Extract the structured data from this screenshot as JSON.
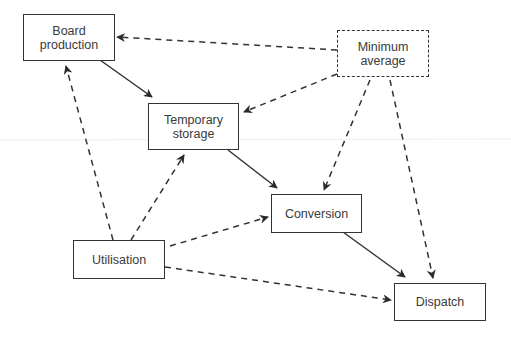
{
  "diagram": {
    "type": "flow",
    "nodes": [
      {
        "id": "board_production",
        "label": "Board\nproduction",
        "style": "solid"
      },
      {
        "id": "temporary_storage",
        "label": "Temporary\nstorage",
        "style": "solid"
      },
      {
        "id": "minimum_average",
        "label": "Minimum\naverage",
        "style": "dashed"
      },
      {
        "id": "conversion",
        "label": "Conversion",
        "style": "solid"
      },
      {
        "id": "utilisation",
        "label": "Utilisation",
        "style": "solid"
      },
      {
        "id": "dispatch",
        "label": "Dispatch",
        "style": "solid"
      }
    ],
    "edges": [
      {
        "from": "board_production",
        "to": "temporary_storage",
        "style": "solid"
      },
      {
        "from": "temporary_storage",
        "to": "conversion",
        "style": "solid"
      },
      {
        "from": "conversion",
        "to": "dispatch",
        "style": "solid"
      },
      {
        "from": "minimum_average",
        "to": "board_production",
        "style": "dashed"
      },
      {
        "from": "minimum_average",
        "to": "temporary_storage",
        "style": "dashed"
      },
      {
        "from": "minimum_average",
        "to": "conversion",
        "style": "dashed"
      },
      {
        "from": "minimum_average",
        "to": "dispatch",
        "style": "dashed"
      },
      {
        "from": "utilisation",
        "to": "board_production",
        "style": "dashed"
      },
      {
        "from": "utilisation",
        "to": "temporary_storage",
        "style": "dashed"
      },
      {
        "from": "utilisation",
        "to": "conversion",
        "style": "dashed"
      },
      {
        "from": "utilisation",
        "to": "dispatch",
        "style": "dashed"
      }
    ],
    "colors": {
      "stroke": "#333333",
      "text": "#3a3a3a",
      "background": "#ffffff"
    }
  }
}
